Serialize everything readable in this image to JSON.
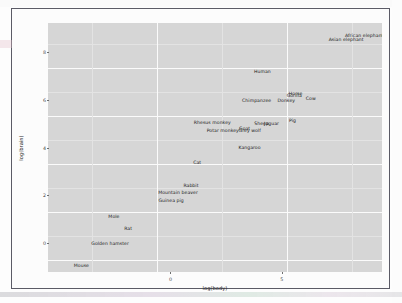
{
  "figure": {
    "background_color": "#fcfcfc",
    "panel_color": "#d6d6d6",
    "gridline_color": "#fbfbfb",
    "label_color": "#1b1b1b"
  },
  "chart_data": {
    "type": "scatter",
    "title": "",
    "subtitle": "",
    "xlabel": "log(body)",
    "ylabel": "log(brain)",
    "xlim": [
      -5.5,
      9.5
    ],
    "ylim": [
      -1.2,
      9.2
    ],
    "xticks": [
      0,
      5
    ],
    "xtick_labels": [
      "0",
      "5"
    ],
    "yticks": [
      0,
      2,
      4,
      6,
      8
    ],
    "ytick_labels": [
      "0",
      "2",
      "4",
      "6",
      "8"
    ],
    "grid": true,
    "legend": "none",
    "label_field": "animal",
    "points": [
      {
        "animal": "African elephant",
        "x": 8.7,
        "y": 8.71
      },
      {
        "animal": "Asian elephant",
        "x": 7.89,
        "y": 8.52
      },
      {
        "animal": "Human",
        "x": 4.13,
        "y": 7.18
      },
      {
        "animal": "Gorilla",
        "x": 5.56,
        "y": 6.2
      },
      {
        "animal": "Cow",
        "x": 6.3,
        "y": 6.08
      },
      {
        "animal": "Donkey",
        "x": 5.2,
        "y": 5.99
      },
      {
        "animal": "Horse",
        "x": 5.62,
        "y": 6.29
      },
      {
        "animal": "Chimpanzee",
        "x": 3.87,
        "y": 5.97
      },
      {
        "animal": "Pig",
        "x": 5.48,
        "y": 5.13
      },
      {
        "animal": "Jaguar",
        "x": 4.54,
        "y": 5.03
      },
      {
        "animal": "Sheep",
        "x": 4.09,
        "y": 5.01
      },
      {
        "animal": "Rhesus monkey",
        "x": 1.88,
        "y": 5.05
      },
      {
        "animal": "Grey wolf",
        "x": 3.56,
        "y": 4.74
      },
      {
        "animal": "Goat",
        "x": 3.33,
        "y": 4.8
      },
      {
        "animal": "Potar monkey",
        "x": 2.35,
        "y": 4.72
      },
      {
        "animal": "Kangaroo",
        "x": 3.55,
        "y": 4.02
      },
      {
        "animal": "Cat",
        "x": 1.2,
        "y": 3.41
      },
      {
        "animal": "Rabbit",
        "x": 0.92,
        "y": 2.44
      },
      {
        "animal": "Mountain beaver",
        "x": 0.34,
        "y": 2.13
      },
      {
        "animal": "Guinea pig",
        "x": 0.03,
        "y": 1.79
      },
      {
        "animal": "Mole",
        "x": -2.54,
        "y": 1.13
      },
      {
        "animal": "Rat",
        "x": -1.9,
        "y": 0.64
      },
      {
        "animal": "Golden hamster",
        "x": -2.71,
        "y": 0.0
      },
      {
        "animal": "Mouse",
        "x": -4.0,
        "y": -0.92
      }
    ]
  }
}
